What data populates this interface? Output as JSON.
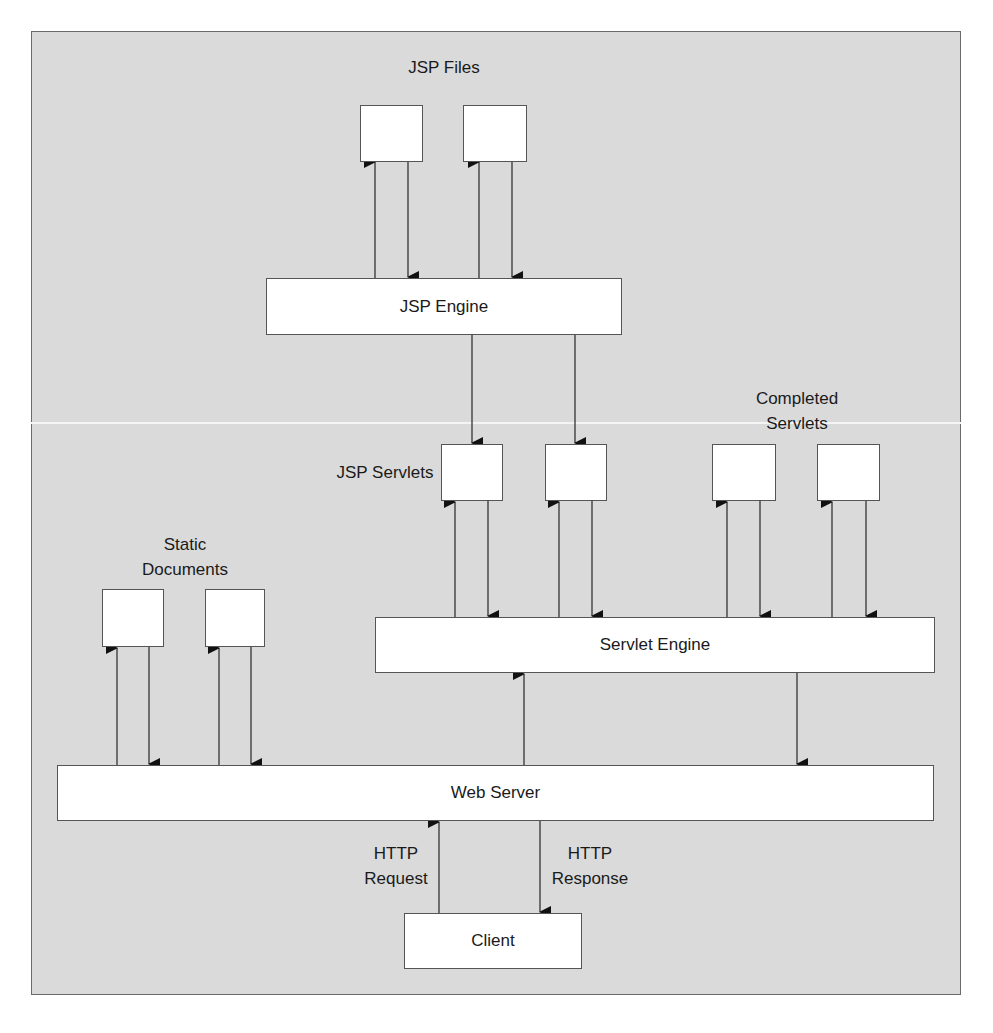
{
  "diagram": {
    "labels": {
      "jsp_files": "JSP Files",
      "jsp_servlets": "JSP Servlets",
      "completed_servlets_line1": "Completed",
      "completed_servlets_line2": "Servlets",
      "static_documents_line1": "Static",
      "static_documents_line2": "Documents",
      "http_request_line1": "HTTP",
      "http_request_line2": "Request",
      "http_response_line1": "HTTP",
      "http_response_line2": "Response"
    },
    "nodes": {
      "jsp_engine": "JSP Engine",
      "servlet_engine": "Servlet Engine",
      "web_server": "Web Server",
      "client": "Client"
    },
    "groups": [
      {
        "name": "JSP Files",
        "count": 2,
        "connected_to": "JSP Engine",
        "flow": "bidirectional"
      },
      {
        "name": "JSP Servlets",
        "count": 2,
        "fed_by": "JSP Engine",
        "connected_to": "Servlet Engine",
        "flow": "bidirectional"
      },
      {
        "name": "Completed Servlets",
        "count": 2,
        "connected_to": "Servlet Engine",
        "flow": "bidirectional"
      },
      {
        "name": "Static Documents",
        "count": 2,
        "connected_to": "Web Server",
        "flow": "bidirectional"
      }
    ],
    "edges": [
      {
        "from": "JSP Engine",
        "to": "JSP File 1"
      },
      {
        "from": "JSP File 1",
        "to": "JSP Engine"
      },
      {
        "from": "JSP Engine",
        "to": "JSP File 2"
      },
      {
        "from": "JSP File 2",
        "to": "JSP Engine"
      },
      {
        "from": "JSP Engine",
        "to": "JSP Servlet 1"
      },
      {
        "from": "JSP Engine",
        "to": "JSP Servlet 2"
      },
      {
        "from": "Servlet Engine",
        "to": "JSP Servlet 1"
      },
      {
        "from": "JSP Servlet 1",
        "to": "Servlet Engine"
      },
      {
        "from": "Servlet Engine",
        "to": "JSP Servlet 2"
      },
      {
        "from": "JSP Servlet 2",
        "to": "Servlet Engine"
      },
      {
        "from": "Servlet Engine",
        "to": "Completed Servlet 1"
      },
      {
        "from": "Completed Servlet 1",
        "to": "Servlet Engine"
      },
      {
        "from": "Servlet Engine",
        "to": "Completed Servlet 2"
      },
      {
        "from": "Completed Servlet 2",
        "to": "Servlet Engine"
      },
      {
        "from": "Web Server",
        "to": "Static Document 1"
      },
      {
        "from": "Static Document 1",
        "to": "Web Server"
      },
      {
        "from": "Web Server",
        "to": "Static Document 2"
      },
      {
        "from": "Static Document 2",
        "to": "Web Server"
      },
      {
        "from": "Web Server",
        "to": "Servlet Engine"
      },
      {
        "from": "Servlet Engine",
        "to": "Web Server"
      },
      {
        "from": "Client",
        "to": "Web Server",
        "label": "HTTP Request"
      },
      {
        "from": "Web Server",
        "to": "Client",
        "label": "HTTP Response"
      }
    ]
  }
}
